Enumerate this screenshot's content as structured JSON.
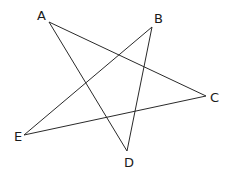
{
  "diagram": {
    "type": "pentagram",
    "points": {
      "A": {
        "label": "A",
        "x": 49,
        "y": 22
      },
      "B": {
        "label": "B",
        "x": 152,
        "y": 27
      },
      "C": {
        "label": "C",
        "x": 206,
        "y": 96
      },
      "D": {
        "label": "D",
        "x": 127,
        "y": 151
      },
      "E": {
        "label": "E",
        "x": 24,
        "y": 135
      }
    },
    "segments": [
      [
        "A",
        "C"
      ],
      [
        "A",
        "D"
      ],
      [
        "B",
        "E"
      ],
      [
        "B",
        "D"
      ],
      [
        "E",
        "C"
      ]
    ],
    "line_color": "#2a2a2a"
  }
}
